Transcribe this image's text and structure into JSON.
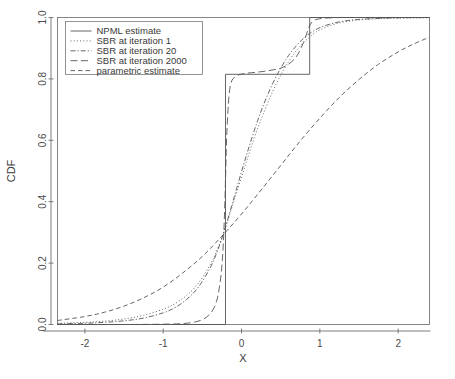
{
  "chart_data": {
    "type": "line",
    "title": "",
    "xlabel": "X",
    "ylabel": "CDF",
    "xlim": [
      -2.35,
      2.4
    ],
    "ylim": [
      0.0,
      1.0
    ],
    "grid": false,
    "legend_position": "top-left",
    "xticks": [
      -2,
      -1,
      0,
      1,
      2
    ],
    "xtick_labels": [
      "-2",
      "-1",
      "0",
      "1",
      "2"
    ],
    "yticks": [
      0.0,
      0.2,
      0.4,
      0.6,
      0.8,
      1.0
    ],
    "ytick_labels": [
      "0.0",
      "0.2",
      "0.4",
      "0.6",
      "0.8",
      "1.0"
    ],
    "series": [
      {
        "name": "NPML estimate",
        "style": "step",
        "dash": "solid",
        "points": [
          [
            -2.35,
            0.0
          ],
          [
            -0.205,
            0.0
          ],
          [
            -0.205,
            0.815
          ],
          [
            0.87,
            0.815
          ],
          [
            0.87,
            1.0
          ],
          [
            2.4,
            1.0
          ]
        ]
      },
      {
        "name": "SBR at iteration 1",
        "style": "smooth",
        "dash": "dotted",
        "points": [
          [
            -2.35,
            0.004
          ],
          [
            -2.0,
            0.007
          ],
          [
            -1.75,
            0.011
          ],
          [
            -1.5,
            0.018
          ],
          [
            -1.25,
            0.03
          ],
          [
            -1.0,
            0.05
          ],
          [
            -0.85,
            0.068
          ],
          [
            -0.7,
            0.095
          ],
          [
            -0.55,
            0.135
          ],
          [
            -0.4,
            0.195
          ],
          [
            -0.3,
            0.25
          ],
          [
            -0.2,
            0.32
          ],
          [
            -0.1,
            0.4
          ],
          [
            0.0,
            0.48
          ],
          [
            0.1,
            0.56
          ],
          [
            0.2,
            0.635
          ],
          [
            0.3,
            0.7
          ],
          [
            0.4,
            0.76
          ],
          [
            0.5,
            0.812
          ],
          [
            0.6,
            0.856
          ],
          [
            0.7,
            0.892
          ],
          [
            0.8,
            0.92
          ],
          [
            0.9,
            0.943
          ],
          [
            1.0,
            0.96
          ],
          [
            1.15,
            0.975
          ],
          [
            1.3,
            0.985
          ],
          [
            1.5,
            0.992
          ],
          [
            1.75,
            0.996
          ],
          [
            2.0,
            0.998
          ],
          [
            2.4,
            0.999
          ]
        ]
      },
      {
        "name": "SBR at iteration 20",
        "style": "smooth",
        "dash": "dashdot",
        "points": [
          [
            -2.35,
            0.002
          ],
          [
            -2.0,
            0.004
          ],
          [
            -1.75,
            0.007
          ],
          [
            -1.5,
            0.012
          ],
          [
            -1.25,
            0.021
          ],
          [
            -1.0,
            0.038
          ],
          [
            -0.85,
            0.055
          ],
          [
            -0.7,
            0.082
          ],
          [
            -0.55,
            0.122
          ],
          [
            -0.4,
            0.185
          ],
          [
            -0.3,
            0.245
          ],
          [
            -0.2,
            0.322
          ],
          [
            -0.1,
            0.41
          ],
          [
            0.0,
            0.498
          ],
          [
            0.1,
            0.582
          ],
          [
            0.2,
            0.66
          ],
          [
            0.3,
            0.728
          ],
          [
            0.4,
            0.786
          ],
          [
            0.5,
            0.835
          ],
          [
            0.6,
            0.876
          ],
          [
            0.7,
            0.908
          ],
          [
            0.8,
            0.934
          ],
          [
            0.9,
            0.953
          ],
          [
            1.0,
            0.967
          ],
          [
            1.15,
            0.98
          ],
          [
            1.3,
            0.988
          ],
          [
            1.5,
            0.994
          ],
          [
            1.75,
            0.997
          ],
          [
            2.0,
            0.999
          ],
          [
            2.4,
            1.0
          ]
        ]
      },
      {
        "name": "SBR at iteration 2000",
        "style": "smooth",
        "dash": "longdash",
        "points": [
          [
            -2.35,
            0.0
          ],
          [
            -1.5,
            0.0
          ],
          [
            -1.0,
            0.001
          ],
          [
            -0.75,
            0.003
          ],
          [
            -0.6,
            0.008
          ],
          [
            -0.5,
            0.016
          ],
          [
            -0.42,
            0.03
          ],
          [
            -0.36,
            0.05
          ],
          [
            -0.32,
            0.075
          ],
          [
            -0.29,
            0.11
          ],
          [
            -0.26,
            0.165
          ],
          [
            -0.24,
            0.23
          ],
          [
            -0.225,
            0.31
          ],
          [
            -0.21,
            0.42
          ],
          [
            -0.2,
            0.52
          ],
          [
            -0.19,
            0.61
          ],
          [
            -0.175,
            0.69
          ],
          [
            -0.16,
            0.745
          ],
          [
            -0.14,
            0.782
          ],
          [
            -0.11,
            0.8
          ],
          [
            -0.05,
            0.812
          ],
          [
            0.05,
            0.818
          ],
          [
            0.2,
            0.822
          ],
          [
            0.35,
            0.827
          ],
          [
            0.5,
            0.835
          ],
          [
            0.6,
            0.848
          ],
          [
            0.68,
            0.866
          ],
          [
            0.74,
            0.89
          ],
          [
            0.79,
            0.918
          ],
          [
            0.83,
            0.946
          ],
          [
            0.86,
            0.968
          ],
          [
            0.89,
            0.982
          ],
          [
            0.93,
            0.991
          ],
          [
            1.0,
            0.996
          ],
          [
            1.15,
            0.999
          ],
          [
            1.4,
            1.0
          ],
          [
            2.4,
            1.0
          ]
        ]
      },
      {
        "name": "parametric estimate",
        "style": "smooth",
        "dash": "dashed",
        "points": [
          [
            -2.35,
            0.013
          ],
          [
            -2.0,
            0.026
          ],
          [
            -1.75,
            0.04
          ],
          [
            -1.5,
            0.06
          ],
          [
            -1.25,
            0.087
          ],
          [
            -1.0,
            0.122
          ],
          [
            -0.75,
            0.168
          ],
          [
            -0.5,
            0.222
          ],
          [
            -0.25,
            0.288
          ],
          [
            0.0,
            0.36
          ],
          [
            0.25,
            0.438
          ],
          [
            0.5,
            0.518
          ],
          [
            0.75,
            0.598
          ],
          [
            1.0,
            0.672
          ],
          [
            1.25,
            0.74
          ],
          [
            1.5,
            0.798
          ],
          [
            1.75,
            0.848
          ],
          [
            2.0,
            0.888
          ],
          [
            2.2,
            0.914
          ],
          [
            2.4,
            0.936
          ]
        ]
      }
    ]
  },
  "axes": {
    "xlabel": "X",
    "ylabel": "CDF"
  },
  "legend": {
    "entries": [
      {
        "label": "NPML estimate"
      },
      {
        "label": "SBR at iteration 1"
      },
      {
        "label": "SBR at iteration 20"
      },
      {
        "label": "SBR at iteration 2000"
      },
      {
        "label": "parametric estimate"
      }
    ]
  },
  "colors": {
    "line": "#555555",
    "axis": "#6e6e6e",
    "text": "#3a3a3a",
    "background": "#ffffff"
  }
}
